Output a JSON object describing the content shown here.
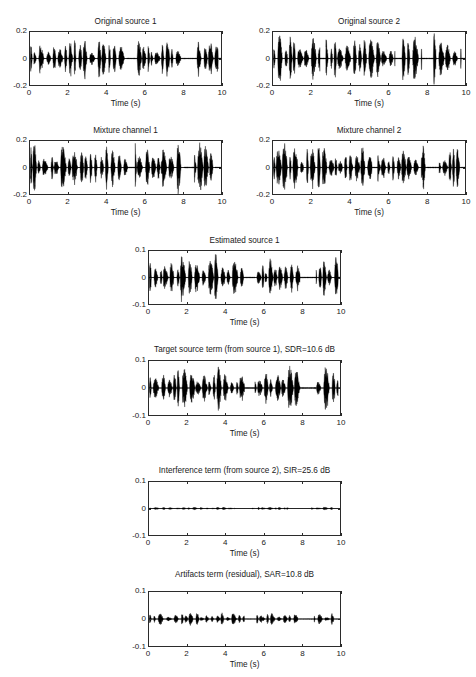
{
  "figure": {
    "background": "#ffffff",
    "line_color": "#000000",
    "axis_color": "#2b2b2b"
  },
  "chart_data": {
    "type": "line",
    "title": "",
    "xlabel": "Time (s)",
    "ylabel": "",
    "xlim": [
      0,
      10
    ],
    "xticks": [
      "0",
      "2",
      "4",
      "6",
      "8",
      "10"
    ],
    "grid": false,
    "legend": "none",
    "panels": [
      {
        "id": "original-source-1",
        "title": "Original source 1",
        "xlabel": "Time (s)",
        "xticks": [
          "0",
          "2",
          "4",
          "6",
          "8",
          "10"
        ],
        "yticks": [
          "0.2",
          "0",
          "-0.2"
        ],
        "ylim": [
          -0.2,
          0.2
        ],
        "xlim": [
          0,
          10
        ],
        "seed": 101,
        "peak": 0.165,
        "density": 1.0,
        "silences": [
          [
            5.05,
            5.55
          ],
          [
            7.95,
            8.75
          ],
          [
            9.85,
            10.0
          ]
        ]
      },
      {
        "id": "original-source-2",
        "title": "Original source 2",
        "xlabel": "Time (s)",
        "xticks": [
          "0",
          "2",
          "4",
          "6",
          "8",
          "10"
        ],
        "yticks": [
          "0.2",
          "0",
          "-0.2"
        ],
        "ylim": [
          -0.2,
          0.2
        ],
        "xlim": [
          0,
          10
        ],
        "seed": 202,
        "peak": 0.2,
        "density": 1.0,
        "silences": [
          [
            2.45,
            2.75
          ],
          [
            6.35,
            6.7
          ],
          [
            7.75,
            8.35
          ],
          [
            9.8,
            10.0
          ]
        ]
      },
      {
        "id": "mixture-channel-1",
        "title": "Mixture channel 1",
        "xlabel": "Time (s)",
        "xticks": [
          "0",
          "2",
          "4",
          "6",
          "8",
          "10"
        ],
        "yticks": [
          "0.2",
          "0",
          "-0.2"
        ],
        "ylim": [
          -0.2,
          0.2
        ],
        "xlim": [
          0,
          10
        ],
        "seed": 303,
        "peak": 0.2,
        "density": 1.0,
        "silences": [
          [
            5.15,
            5.5
          ],
          [
            8.05,
            8.6
          ],
          [
            9.7,
            10.0
          ]
        ]
      },
      {
        "id": "mixture-channel-2",
        "title": "Mixture channel 2",
        "xlabel": "Time (s)",
        "xticks": [
          "0",
          "2",
          "4",
          "6",
          "8",
          "10"
        ],
        "yticks": [
          "0.2",
          "0",
          "-0.2"
        ],
        "ylim": [
          -0.2,
          0.2
        ],
        "xlim": [
          0,
          10
        ],
        "seed": 404,
        "peak": 0.2,
        "density": 1.0,
        "silences": [
          [
            5.15,
            5.45
          ],
          [
            8.0,
            8.65
          ],
          [
            9.8,
            10.0
          ]
        ]
      },
      {
        "id": "estimated-source-1",
        "title": "Estimated source 1",
        "xlabel": "Time (s)",
        "xticks": [
          "0",
          "2",
          "4",
          "6",
          "8",
          "10"
        ],
        "yticks": [
          "0.1",
          "0",
          "-0.1"
        ],
        "ylim": [
          -0.1,
          0.1
        ],
        "xlim": [
          0,
          10
        ],
        "seed": 505,
        "peak": 0.092,
        "density": 1.0,
        "silences": [
          [
            5.0,
            5.55
          ],
          [
            7.9,
            8.75
          ],
          [
            9.9,
            10.0
          ]
        ]
      },
      {
        "id": "target-source-term",
        "title": "Target source term (from source 1), SDR=10.6 dB",
        "metric": {
          "name": "SDR",
          "value": 10.6,
          "unit": "dB"
        },
        "xlabel": "Time (s)",
        "xticks": [
          "0",
          "2",
          "4",
          "6",
          "8",
          "10"
        ],
        "yticks": [
          "0.1",
          "0",
          "-0.1"
        ],
        "ylim": [
          -0.1,
          0.1
        ],
        "xlim": [
          0,
          10
        ],
        "seed": 606,
        "peak": 0.09,
        "density": 1.0,
        "silences": [
          [
            5.0,
            5.55
          ],
          [
            7.9,
            8.7
          ],
          [
            9.9,
            10.0
          ]
        ]
      },
      {
        "id": "interference-term",
        "title": "Interference term (from source 2), SIR=25.6 dB",
        "metric": {
          "name": "SIR",
          "value": 25.6,
          "unit": "dB"
        },
        "xlabel": "Time (s)",
        "xticks": [
          "0",
          "2",
          "4",
          "6",
          "8",
          "10"
        ],
        "yticks": [
          "0.1",
          "0",
          "-0.1"
        ],
        "ylim": [
          -0.1,
          0.1
        ],
        "xlim": [
          0,
          10
        ],
        "seed": 707,
        "peak": 0.012,
        "density": 0.55,
        "silences": [
          [
            4.5,
            5.4
          ],
          [
            7.3,
            8.5
          ],
          [
            9.6,
            10.0
          ]
        ]
      },
      {
        "id": "artifacts-term",
        "title": "Artifacts term (residual), SAR=10.8 dB",
        "metric": {
          "name": "SAR",
          "value": 10.8,
          "unit": "dB"
        },
        "xlabel": "Time (s)",
        "xticks": [
          "0",
          "2",
          "4",
          "6",
          "8",
          "10"
        ],
        "yticks": [
          "0.1",
          "0",
          "-0.1"
        ],
        "ylim": [
          -0.1,
          0.1
        ],
        "xlim": [
          0,
          10
        ],
        "seed": 808,
        "peak": 0.028,
        "density": 0.9,
        "silences": [
          [
            5.0,
            5.5
          ],
          [
            7.85,
            8.65
          ],
          [
            9.7,
            10.0
          ]
        ]
      }
    ]
  },
  "layout": {
    "panels": [
      {
        "box": [
          29,
          31,
          193,
          55
        ],
        "title_top": 17,
        "ylabel_w": 26,
        "xtick_y": 89,
        "xlabel_y": 99
      },
      {
        "box": [
          272,
          31,
          194,
          55
        ],
        "title_top": 17,
        "ylabel_w": 26,
        "xtick_y": 89,
        "xlabel_y": 99
      },
      {
        "box": [
          29,
          140,
          193,
          55
        ],
        "title_top": 126,
        "ylabel_w": 26,
        "xtick_y": 198,
        "xlabel_y": 208
      },
      {
        "box": [
          272,
          140,
          194,
          55
        ],
        "title_top": 126,
        "ylabel_w": 26,
        "xtick_y": 198,
        "xlabel_y": 208
      },
      {
        "box": [
          148,
          250,
          193,
          55
        ],
        "title_top": 236,
        "ylabel_w": 26,
        "xtick_y": 308,
        "xlabel_y": 318
      },
      {
        "box": [
          148,
          360,
          193,
          56
        ],
        "title_top": 345,
        "ylabel_w": 26,
        "xtick_y": 419,
        "xlabel_y": 429
      },
      {
        "box": [
          148,
          481,
          193,
          55
        ],
        "title_top": 466,
        "ylabel_w": 26,
        "xtick_y": 539,
        "xlabel_y": 549
      },
      {
        "box": [
          148,
          591,
          193,
          56
        ],
        "title_top": 570,
        "ylabel_w": 26,
        "xtick_y": 650,
        "xlabel_y": 660
      }
    ]
  }
}
